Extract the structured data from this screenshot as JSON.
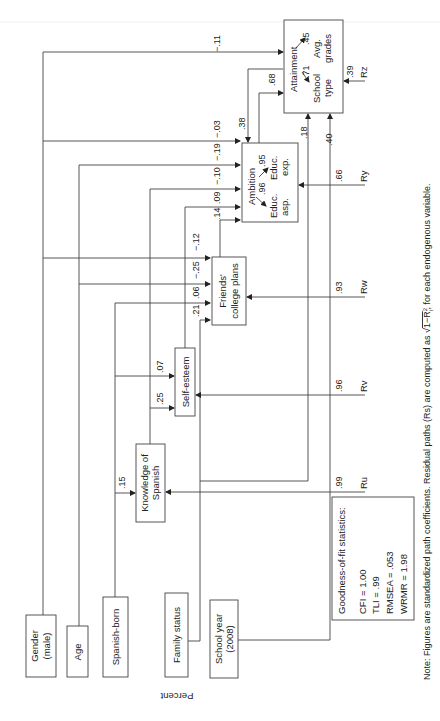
{
  "diagram": {
    "orientation": "rotated-90-ccw",
    "nodes": {
      "gender": {
        "line1": "Gender",
        "line2": "(male)"
      },
      "age": {
        "label": "Age"
      },
      "spanish_born": {
        "label": "Spanish-born"
      },
      "family_status": {
        "label": "Family status"
      },
      "school_year": {
        "line1": "School year",
        "line2": "(2008)"
      },
      "knowledge": {
        "line1": "Knowledge of",
        "line2": "Spanish"
      },
      "self_esteem": {
        "label": "Self-esteem"
      },
      "friends": {
        "line1": "Friends'",
        "line2": "college plans"
      },
      "ambition": {
        "title": "Ambition",
        "ind1": "Educ.",
        "ind1b": "asp.",
        "load1": ".96",
        "ind2": "Educ.",
        "ind2b": "exp.",
        "load2": ".95"
      },
      "attainment": {
        "title": "Attainment",
        "ind1": "School",
        "ind1b": "type",
        "load1": ".71",
        "ind2": "Avg.",
        "ind2b": "grades",
        "load2": ".45"
      }
    },
    "paths": {
      "spanishborn_knowledge": ".15",
      "spanishborn_selfesteem": ".25",
      "familystatus_selfesteem": ".07",
      "to_friends": [
        ".21",
        ".06",
        "−.25",
        "−.12"
      ],
      "to_ambition": [
        ".14",
        ".09",
        "−.10",
        "−.19",
        "−.03"
      ],
      "gender_attainment": "−.11",
      "attainment_ambition": ".38",
      "ambition_attainment": ".68",
      "knowledge_attainment": ".18",
      "schoolyear_attainment": ".40"
    },
    "residuals": {
      "ru": {
        "label": "Ru",
        "value": ".99"
      },
      "rv": {
        "label": "Rv",
        "value": ".96"
      },
      "rw": {
        "label": "Rw",
        "value": ".93"
      },
      "ry": {
        "label": "Ry",
        "value": ".66"
      },
      "rz": {
        "label": "Rz",
        "value": ".39"
      }
    },
    "fit": {
      "title": "Goodness-of-fit statistics:",
      "cfi": "CFI = 1.00",
      "tli": "TLI = .99",
      "rmsea": "RMSEA = .053",
      "wrmr": "WRMR = 1.98"
    },
    "stray_label": "Percent",
    "note_a": "Note: Figures are standardized path coefficients. Residual paths (Rs) are computed as ",
    "note_sqrt": "1−R",
    "note_sup": "2",
    "note_sub": "i",
    "note_b": ", for each endogenous variable."
  }
}
